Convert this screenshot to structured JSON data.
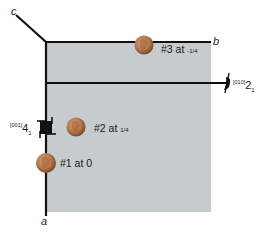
{
  "colors": {
    "cell_fill": "#c6ccce",
    "line": "#111111",
    "coin_light": "#c98e62",
    "coin_dark": "#8a4f2e",
    "background": "#ffffff"
  },
  "axes": {
    "a": "a",
    "b": "b",
    "c": "c"
  },
  "symmetry_elements": {
    "screw_4": {
      "direction": "[001]",
      "symbol": "4",
      "subscript": "1"
    },
    "screw_2": {
      "direction": "[010]",
      "symbol": "2",
      "subscript": "1"
    }
  },
  "coins": [
    {
      "label_prefix": "#1 at",
      "value": "0"
    },
    {
      "label_prefix": "#2 at",
      "value": "1/4"
    },
    {
      "label_prefix": "#3 at",
      "value": "-1/4"
    }
  ]
}
